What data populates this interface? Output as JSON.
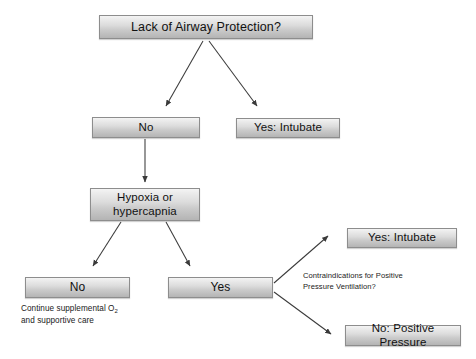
{
  "diagram": {
    "type": "flowchart",
    "background_color": "#ffffff",
    "node_fill_top": "#f4f4f4",
    "node_fill_bottom": "#b4b4b4",
    "node_border_color": "#8d8d8d",
    "arrow_color": "#3a3a3a",
    "text_color": "#111111"
  },
  "nodes": {
    "root": {
      "label": "Lack of Airway Protection?"
    },
    "no1": {
      "label": "No"
    },
    "yes_intubate_1": {
      "label": "Yes: Intubate"
    },
    "hypoxia": {
      "label": "Hypoxia or hypercapnia"
    },
    "no2": {
      "label": "No"
    },
    "yes2": {
      "label": "Yes"
    },
    "yes_intubate_2": {
      "label": "Yes: Intubate"
    },
    "no_positive_pressure": {
      "label": "No: Positive Pressure"
    }
  },
  "captions": {
    "supportive_care_line1": "Continue supplemental O",
    "supportive_care_sub": "2",
    "supportive_care_line2": "and supportive care",
    "contraindications": "Contraindications for Positive Pressure Ventilation?"
  },
  "edges": [
    {
      "from": "root",
      "to": "no1",
      "label": ""
    },
    {
      "from": "root",
      "to": "yes_intubate_1",
      "label": ""
    },
    {
      "from": "no1",
      "to": "hypoxia",
      "label": ""
    },
    {
      "from": "hypoxia",
      "to": "no2",
      "label": ""
    },
    {
      "from": "hypoxia",
      "to": "yes2",
      "label": ""
    },
    {
      "from": "yes2",
      "to": "yes_intubate_2",
      "label": ""
    },
    {
      "from": "yes2",
      "to": "no_positive_pressure",
      "label": ""
    }
  ]
}
